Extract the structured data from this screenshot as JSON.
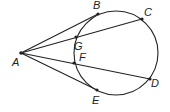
{
  "diagram": {
    "type": "geometry",
    "circle": {
      "cx": 116,
      "cy": 53,
      "r": 42
    },
    "points": {
      "A": {
        "label": "A",
        "x": 21,
        "y": 53,
        "lx": 12,
        "ly": 66
      },
      "B": {
        "label": "B",
        "x": 98,
        "y": 14,
        "lx": 93,
        "ly": 9
      },
      "C": {
        "label": "C",
        "x": 142,
        "y": 19,
        "lx": 144,
        "ly": 16
      },
      "G": {
        "label": "G",
        "x": 76,
        "y": 37,
        "lx": 74,
        "ly": 50
      },
      "F": {
        "label": "F",
        "x": 74,
        "y": 63,
        "lx": 79,
        "ly": 61
      },
      "D": {
        "label": "D",
        "x": 150,
        "y": 79,
        "lx": 151,
        "ly": 87
      },
      "E": {
        "label": "E",
        "x": 97,
        "y": 90,
        "lx": 92,
        "ly": 104
      }
    },
    "segments": [
      [
        "A",
        "B"
      ],
      [
        "A",
        "C"
      ],
      [
        "A",
        "D"
      ],
      [
        "A",
        "E"
      ]
    ],
    "line_color": "#222222"
  }
}
